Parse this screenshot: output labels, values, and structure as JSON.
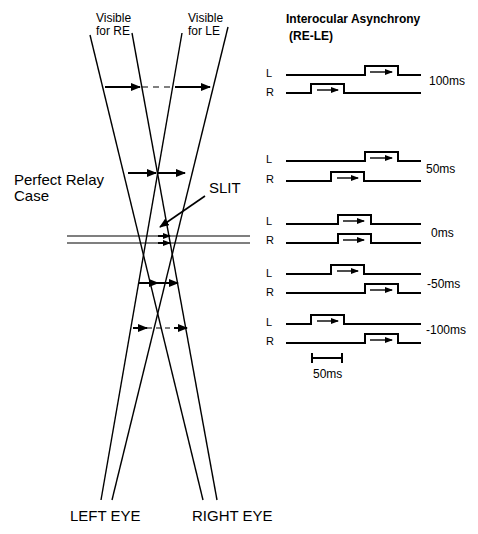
{
  "diagram": {
    "top_labels": {
      "visible_re": [
        "Visible",
        "for RE"
      ],
      "visible_le": [
        "Visible",
        "for LE"
      ]
    },
    "side_label": [
      "Perfect Relay",
      "Case"
    ],
    "slit_label": "SLIT",
    "bottom_labels": {
      "left_eye": "LEFT EYE",
      "right_eye": "RIGHT EYE"
    }
  },
  "timing_panel": {
    "title": "Interocular Asynchrony",
    "subtitle": "(RE-LE)",
    "eye_labels": {
      "left": "L",
      "right": "R"
    },
    "conditions": [
      {
        "asynchrony": "100ms",
        "l_pulse_start": 365,
        "r_pulse_start": 311
      },
      {
        "asynchrony": "50ms",
        "l_pulse_start": 365,
        "r_pulse_start": 331
      },
      {
        "asynchrony": "0ms",
        "l_pulse_start": 338,
        "r_pulse_start": 338
      },
      {
        "asynchrony": "-50ms",
        "l_pulse_start": 331,
        "r_pulse_start": 365
      },
      {
        "asynchrony": "-100ms",
        "l_pulse_start": 311,
        "r_pulse_start": 365
      }
    ],
    "scale_bar_label": "50ms"
  }
}
